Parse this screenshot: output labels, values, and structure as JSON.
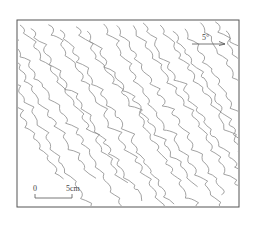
{
  "figure": {
    "type": "fold-trace-sketch",
    "orientation_label": "5°",
    "scale_bar": {
      "start_label": "0",
      "end_label": "5cm"
    }
  },
  "colors": {
    "frame": "#555555",
    "lines": "#8a8a8a",
    "background": "#ffffff"
  }
}
